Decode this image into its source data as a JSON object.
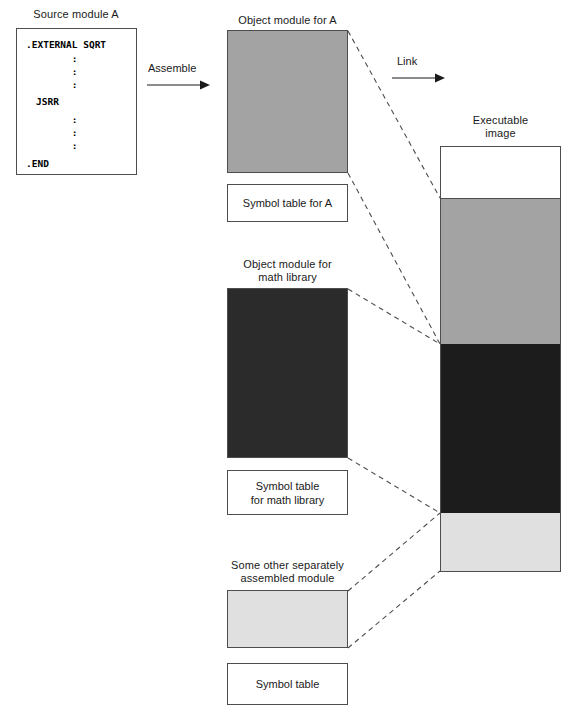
{
  "diagram": {
    "title_colors": {
      "object_module_a_fill": "#a3a3a3",
      "math_library_fill": "#2b2b2b",
      "other_module_fill": "#e0e0e0",
      "exec_segment_1_fill": "#ffffff",
      "exec_segment_2_fill": "#a3a3a3",
      "exec_segment_3_fill": "#1c1c1c",
      "exec_segment_4_fill": "#e0e0e0",
      "border": "#4d4d4d",
      "dashed_line": "#4d4d4d"
    },
    "source_module": {
      "caption": "Source module A",
      "code_lines": [
        ".EXTERNAL SQRT",
        "        :",
        "        :",
        "        :",
        "JSRR",
        "        :",
        "        :",
        "        :",
        ".END"
      ]
    },
    "arrows": {
      "assemble": "Assemble",
      "link": "Link"
    },
    "object_modules": [
      {
        "caption": "Object module for A",
        "symbol_table": "Symbol table for A"
      },
      {
        "caption": "Object module for\nmath library",
        "symbol_table": "Symbol table\nfor math library"
      },
      {
        "caption": "Some other separately\nassembled module",
        "symbol_table": "Symbol table"
      }
    ],
    "executable": {
      "caption": "Executable\nimage"
    }
  }
}
